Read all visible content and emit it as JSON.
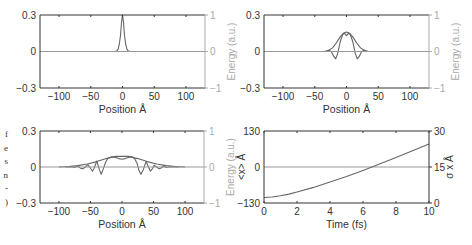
{
  "side_text": [
    "f",
    "e",
    "s",
    "n",
    "-",
    ")"
  ],
  "colors": {
    "axis": "#333333",
    "right_axis": "#aaaaaa",
    "curve": "#666666",
    "zero_line": "#999999",
    "text": "#333333"
  },
  "chart_data": [
    {
      "type": "line",
      "panel": "top-left",
      "xlabel": "Position Å",
      "ylabel": "",
      "ylabel_right": "Energy (a.u.)",
      "xlim": [
        -130,
        130
      ],
      "ylim": [
        -0.3,
        0.3
      ],
      "ylim_right": [
        -1,
        1
      ],
      "xticks": [
        -100,
        -50,
        0,
        50,
        100
      ],
      "yticks": [
        "-0.3",
        "0",
        "0.3"
      ],
      "yticks_right": [
        "-1",
        "0",
        "1"
      ],
      "grid": false,
      "series": [
        {
          "name": "wavepacket",
          "x": [
            -130,
            -12,
            -9,
            -7,
            -5,
            -3,
            -1.5,
            0,
            1.5,
            3,
            5,
            7,
            9,
            12,
            130
          ],
          "y": [
            0,
            0,
            0.005,
            0.02,
            0.06,
            0.14,
            0.24,
            0.3,
            0.24,
            0.14,
            0.06,
            0.02,
            0.005,
            0,
            0
          ]
        },
        {
          "name": "potential",
          "x": [
            -130,
            130
          ],
          "y": [
            0,
            0
          ]
        }
      ]
    },
    {
      "type": "line",
      "panel": "top-right",
      "xlabel": "Position Å",
      "ylabel": "",
      "ylabel_right": "Energy (a.u.)",
      "xlim": [
        -130,
        130
      ],
      "ylim": [
        -0.3,
        0.3
      ],
      "ylim_right": [
        -1,
        1
      ],
      "xticks": [
        -100,
        -50,
        0,
        50,
        100
      ],
      "yticks": [
        "-0.3",
        "0",
        "0.3"
      ],
      "yticks_right": [
        "-1",
        "0",
        "1"
      ],
      "grid": false,
      "series": [
        {
          "name": "envelope",
          "x": [
            -35,
            -28,
            -22,
            -16,
            -10,
            -5,
            0,
            5,
            10,
            16,
            22,
            28,
            35
          ],
          "y": [
            0,
            0.01,
            0.03,
            0.07,
            0.12,
            0.15,
            0.16,
            0.15,
            0.12,
            0.07,
            0.03,
            0.01,
            0
          ]
        },
        {
          "name": "real-part",
          "x": [
            -32,
            -28,
            -24,
            -20,
            -17,
            -14,
            -10,
            -6,
            -3,
            0,
            3,
            6,
            10,
            14,
            17,
            20,
            24,
            28,
            32
          ],
          "y": [
            0,
            0.01,
            0.0,
            -0.04,
            -0.06,
            -0.02,
            0.08,
            0.14,
            0.15,
            0.13,
            0.15,
            0.14,
            0.08,
            -0.02,
            -0.06,
            -0.04,
            0.0,
            0.01,
            0
          ]
        },
        {
          "name": "potential",
          "x": [
            -130,
            130
          ],
          "y": [
            0,
            0
          ]
        }
      ]
    },
    {
      "type": "line",
      "panel": "bottom-left",
      "xlabel": "Position Å",
      "ylabel": "",
      "ylabel_right": "Energy (a.u.)",
      "xlim": [
        -130,
        130
      ],
      "ylim": [
        -0.3,
        0.3
      ],
      "ylim_right": [
        -1,
        1
      ],
      "xticks": [
        -100,
        -50,
        0,
        50,
        100
      ],
      "yticks": [
        "-0.3",
        "0",
        "0.3"
      ],
      "yticks_right": [
        "-1",
        "0",
        "1"
      ],
      "grid": false,
      "series": [
        {
          "name": "envelope",
          "x": [
            -100,
            -85,
            -70,
            -55,
            -40,
            -25,
            -10,
            0,
            10,
            25,
            40,
            55,
            70,
            85,
            100
          ],
          "y": [
            0,
            0.004,
            0.012,
            0.025,
            0.045,
            0.07,
            0.088,
            0.09,
            0.088,
            0.07,
            0.045,
            0.025,
            0.012,
            0.004,
            0
          ]
        },
        {
          "name": "real-part",
          "x": [
            -90,
            -80,
            -75,
            -70,
            -66,
            -62,
            -58,
            -54,
            -50,
            -47,
            -44,
            -40,
            -36,
            -33,
            -30,
            -26,
            -22,
            -16,
            -10,
            -5,
            0,
            5,
            10,
            16,
            20,
            24,
            27,
            30,
            34,
            38,
            42,
            45,
            48,
            51,
            55,
            59,
            62,
            66,
            70,
            75,
            80,
            90
          ],
          "y": [
            0,
            0.002,
            -0.004,
            0.008,
            -0.01,
            -0.015,
            0.0,
            0.02,
            -0.01,
            -0.035,
            -0.01,
            0.05,
            -0.02,
            -0.06,
            -0.02,
            0.04,
            0.075,
            0.085,
            0.08,
            0.07,
            0.065,
            0.07,
            0.08,
            0.085,
            0.07,
            0.03,
            -0.03,
            -0.06,
            -0.02,
            0.045,
            0.0,
            -0.035,
            -0.015,
            0.015,
            0.0,
            -0.015,
            -0.008,
            0.008,
            -0.004,
            0.002,
            0,
            0
          ]
        },
        {
          "name": "potential",
          "x": [
            -130,
            130
          ],
          "y": [
            0,
            0
          ]
        }
      ]
    },
    {
      "type": "line",
      "panel": "bottom-right",
      "xlabel": "Time (fs)",
      "ylabel": "<x> Å",
      "ylabel_right": "σ x Å",
      "xlim": [
        0,
        10
      ],
      "ylim": [
        -130,
        130
      ],
      "ylim_right": [
        0,
        30
      ],
      "xticks": [
        0,
        2,
        4,
        6,
        8,
        10
      ],
      "yticks": [
        "-130",
        "0",
        "130"
      ],
      "yticks_right": [
        "0",
        "15",
        "30"
      ],
      "grid": false,
      "series": [
        {
          "name": "<x>",
          "axis": "left",
          "x": [
            0,
            10
          ],
          "y": [
            0,
            0
          ]
        },
        {
          "name": "sigma_x",
          "axis": "right",
          "x": [
            0,
            0.5,
            1,
            1.5,
            2,
            3,
            4,
            5,
            6,
            7,
            8,
            9,
            10
          ],
          "y": [
            2.3,
            2.5,
            3.0,
            3.7,
            4.6,
            6.5,
            8.7,
            11.0,
            13.6,
            16.3,
            19.0,
            21.8,
            24.6
          ]
        }
      ]
    }
  ]
}
